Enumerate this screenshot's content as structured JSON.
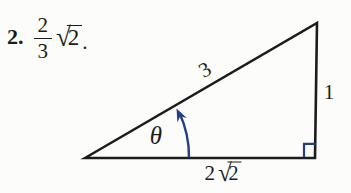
{
  "problem": {
    "number": "2.",
    "fraction": {
      "numerator": "2",
      "denominator": "3"
    },
    "radical": {
      "sign": "√",
      "radicand": "2"
    },
    "period": "."
  },
  "figure": {
    "hypotenuse_label": "3",
    "opposite_label": "1",
    "angle_label": "θ",
    "base": {
      "coefficient": "2",
      "radical_sign": "√",
      "radicand": "2"
    }
  },
  "colors": {
    "ink": "#1c1c1c",
    "accent": "#223e85",
    "background": "#fcfcfa"
  }
}
